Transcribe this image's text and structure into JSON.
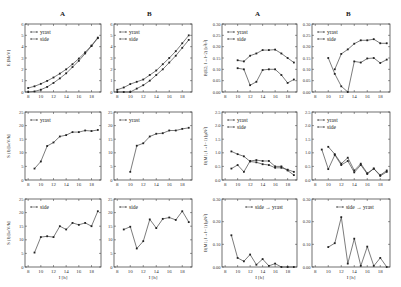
{
  "column_headers": [
    "A",
    "B",
    "A",
    "B"
  ],
  "chart_data": [
    {
      "id": "E-A",
      "type": "line",
      "column": "A",
      "row": 1,
      "ylabel": "E [MeV]",
      "xlabel": "",
      "xlim": [
        7.5,
        19.5
      ],
      "ylim": [
        0,
        6
      ],
      "xticks": [
        8,
        10,
        12,
        14,
        16,
        18
      ],
      "yticks": [
        0,
        1,
        2,
        3,
        4,
        5,
        6
      ],
      "legend": [
        "yrast",
        "side"
      ],
      "legend_position": "upper-left",
      "series": [
        {
          "name": "yrast",
          "x": [
            8,
            9,
            10,
            11,
            12,
            13,
            14,
            15,
            16,
            17,
            18,
            19
          ],
          "values": [
            0.35,
            0.5,
            0.72,
            0.98,
            1.28,
            1.62,
            2.0,
            2.45,
            2.95,
            3.5,
            4.1,
            4.8
          ]
        },
        {
          "name": "side",
          "x": [
            8,
            9,
            10,
            11,
            12,
            13,
            14,
            15,
            16,
            17,
            18,
            19
          ],
          "values": [
            0.0,
            0.05,
            0.2,
            0.45,
            0.8,
            1.2,
            1.65,
            2.2,
            2.75,
            3.4,
            4.05,
            4.75
          ]
        }
      ]
    },
    {
      "id": "E-B",
      "type": "line",
      "column": "B",
      "row": 1,
      "ylabel": "",
      "xlabel": "",
      "xlim": [
        7.5,
        19.5
      ],
      "ylim": [
        0,
        6
      ],
      "xticks": [
        8,
        10,
        12,
        14,
        16,
        18
      ],
      "yticks": [
        0,
        1,
        2,
        3,
        4,
        5,
        6
      ],
      "legend": [
        "yrast",
        "side"
      ],
      "legend_position": "upper-left",
      "series": [
        {
          "name": "yrast",
          "x": [
            8,
            9,
            10,
            11,
            12,
            13,
            14,
            15,
            16,
            17,
            18,
            19
          ],
          "values": [
            0.2,
            0.4,
            0.7,
            0.9,
            1.1,
            1.5,
            1.9,
            2.45,
            3.0,
            3.6,
            4.3,
            5.0
          ]
        },
        {
          "name": "side",
          "x": [
            8,
            9,
            10,
            11,
            12,
            13,
            14,
            15,
            16,
            17,
            18,
            19
          ],
          "values": [
            0.0,
            0.0,
            0.0,
            0.3,
            0.6,
            1.0,
            1.5,
            2.0,
            2.6,
            3.2,
            3.9,
            4.6
          ]
        }
      ]
    },
    {
      "id": "BE2-A",
      "type": "line",
      "column": "A",
      "row": 1,
      "ylabel": "B(E2; I→I−2) [e²b²]",
      "xlabel": "",
      "xlim": [
        7.5,
        19.5
      ],
      "ylim": [
        0,
        0.3
      ],
      "xticks": [
        8,
        10,
        12,
        14,
        16,
        18
      ],
      "yticks": [
        0.0,
        0.05,
        0.1,
        0.15,
        0.2,
        0.25,
        0.3
      ],
      "legend": [
        "yrast",
        "side"
      ],
      "legend_position": "upper-left",
      "series": [
        {
          "name": "yrast",
          "x": [
            10,
            11,
            12,
            13,
            14,
            15,
            16,
            17,
            18,
            19
          ],
          "values": [
            0.14,
            0.135,
            0.16,
            0.17,
            0.185,
            0.185,
            0.187,
            0.17,
            0.15,
            0.13
          ]
        },
        {
          "name": "side",
          "x": [
            10,
            11,
            12,
            13,
            14,
            15,
            16,
            17,
            18,
            19
          ],
          "values": [
            0.105,
            0.1,
            0.03,
            0.045,
            0.097,
            0.1,
            0.1,
            0.075,
            0.04,
            0.055
          ]
        }
      ]
    },
    {
      "id": "BE2-B",
      "type": "line",
      "column": "B",
      "row": 1,
      "ylabel": "",
      "xlabel": "",
      "xlim": [
        7.5,
        19.5
      ],
      "ylim": [
        0,
        0.3
      ],
      "xticks": [
        8,
        10,
        12,
        14,
        16,
        18
      ],
      "yticks": [
        0.0,
        0.05,
        0.1,
        0.15,
        0.2,
        0.25,
        0.3
      ],
      "legend": [
        "yrast",
        "side"
      ],
      "legend_position": "upper-left",
      "series": [
        {
          "name": "yrast",
          "x": [
            11,
            12,
            13,
            14,
            15,
            16,
            17,
            18,
            19
          ],
          "values": [
            0.1,
            0.168,
            0.188,
            0.213,
            0.228,
            0.228,
            0.233,
            0.215,
            0.215
          ]
        },
        {
          "name": "side",
          "x": [
            10,
            11,
            12,
            13,
            14,
            15,
            16,
            17,
            18,
            19
          ],
          "values": [
            0.15,
            0.08,
            0.025,
            0.0,
            0.135,
            0.13,
            0.148,
            0.15,
            0.128,
            0.143
          ]
        }
      ]
    },
    {
      "id": "S-yrast-A",
      "type": "line",
      "column": "A",
      "row": 2,
      "ylabel": "S (I) [keV/ħ]",
      "xlabel": "",
      "xlim": [
        7.5,
        19.5
      ],
      "ylim": [
        0,
        25
      ],
      "xticks": [
        8,
        10,
        12,
        14,
        16,
        18
      ],
      "yticks": [
        0,
        5,
        10,
        15,
        20,
        25
      ],
      "legend": [
        "yrast"
      ],
      "legend_position": "upper-left",
      "series": [
        {
          "name": "yrast",
          "x": [
            9,
            10,
            11,
            12,
            13,
            14,
            15,
            16,
            17,
            18,
            19
          ],
          "values": [
            4.2,
            6.8,
            12.5,
            13.8,
            16.0,
            16.5,
            17.6,
            17.6,
            18.2,
            18.0,
            18.4
          ]
        }
      ]
    },
    {
      "id": "S-yrast-B",
      "type": "line",
      "column": "B",
      "row": 2,
      "ylabel": "",
      "xlabel": "",
      "xlim": [
        7.5,
        19.5
      ],
      "ylim": [
        0,
        25
      ],
      "xticks": [
        8,
        10,
        12,
        14,
        16,
        18
      ],
      "yticks": [
        0,
        5,
        10,
        15,
        20,
        25
      ],
      "legend": [
        "yrast"
      ],
      "legend_position": "upper-left",
      "series": [
        {
          "name": "yrast",
          "x": [
            10,
            11,
            12,
            13,
            14,
            15,
            16,
            17,
            18,
            19
          ],
          "values": [
            3.0,
            12.6,
            13.5,
            16.0,
            17.0,
            17.2,
            18.2,
            18.2,
            18.8,
            19.2
          ]
        }
      ]
    },
    {
      "id": "BM1-A",
      "type": "line",
      "column": "A",
      "row": 2,
      "ylabel": "B(M1; I→I−1) [μN²]",
      "xlabel": "",
      "xlim": [
        7.5,
        19.5
      ],
      "ylim": [
        0,
        2.5
      ],
      "xticks": [
        8,
        10,
        12,
        14,
        16,
        18
      ],
      "yticks": [
        0.0,
        0.5,
        1.0,
        1.5,
        2.0,
        2.5
      ],
      "legend": [
        "yrast",
        "side"
      ],
      "legend_position": "upper-left",
      "series": [
        {
          "name": "yrast",
          "x": [
            9,
            10,
            11,
            12,
            13,
            14,
            15,
            16,
            17,
            18,
            19
          ],
          "values": [
            1.05,
            0.95,
            0.87,
            0.68,
            0.65,
            0.58,
            0.55,
            0.45,
            0.45,
            0.38,
            0.3
          ]
        },
        {
          "name": "side",
          "x": [
            9,
            10,
            11,
            12,
            13,
            14,
            15,
            16,
            17,
            18,
            19
          ],
          "values": [
            0.42,
            0.55,
            0.3,
            0.7,
            0.73,
            0.7,
            0.7,
            0.5,
            0.5,
            0.35,
            0.18
          ]
        }
      ]
    },
    {
      "id": "BM1-B",
      "type": "line",
      "column": "B",
      "row": 2,
      "ylabel": "",
      "xlabel": "",
      "xlim": [
        7.5,
        19.5
      ],
      "ylim": [
        0,
        2.5
      ],
      "xticks": [
        8,
        10,
        12,
        14,
        16,
        18
      ],
      "yticks": [
        0.0,
        0.5,
        1.0,
        1.5,
        2.0,
        2.5
      ],
      "legend": [
        "yrast",
        "side"
      ],
      "legend_position": "upper-left",
      "series": [
        {
          "name": "yrast",
          "x": [
            10,
            11,
            12,
            13,
            14,
            15,
            16,
            17,
            18,
            19
          ],
          "values": [
            1.22,
            0.95,
            0.6,
            0.82,
            0.35,
            0.6,
            0.25,
            0.42,
            0.18,
            0.35
          ]
        },
        {
          "name": "side",
          "x": [
            9,
            10,
            11,
            12,
            13,
            14,
            15,
            16,
            17,
            18,
            19
          ],
          "values": [
            1.12,
            0.4,
            0.92,
            0.55,
            0.7,
            0.28,
            0.55,
            0.22,
            0.42,
            0.15,
            0.3
          ]
        }
      ]
    },
    {
      "id": "S-side-A",
      "type": "line",
      "column": "A",
      "row": 3,
      "ylabel": "S (I) [keV/ħ]",
      "xlabel": "I [ħ]",
      "xlim": [
        7.5,
        19.5
      ],
      "ylim": [
        0,
        25
      ],
      "xticks": [
        8,
        10,
        12,
        14,
        16,
        18
      ],
      "yticks": [
        0,
        5,
        10,
        15,
        20,
        25
      ],
      "legend": [
        "side"
      ],
      "legend_position": "upper-left",
      "series": [
        {
          "name": "side",
          "x": [
            9,
            10,
            11,
            12,
            13,
            14,
            15,
            16,
            17,
            18,
            19
          ],
          "values": [
            5.3,
            11.0,
            11.3,
            11.0,
            15.0,
            13.8,
            16.2,
            15.5,
            16.2,
            15.0,
            20.5
          ]
        }
      ]
    },
    {
      "id": "S-side-B",
      "type": "line",
      "column": "B",
      "row": 3,
      "ylabel": "",
      "xlabel": "I [ħ]",
      "xlim": [
        7.5,
        19.5
      ],
      "ylim": [
        0,
        25
      ],
      "xticks": [
        8,
        10,
        12,
        14,
        16,
        18
      ],
      "yticks": [
        0,
        5,
        10,
        15,
        20,
        25
      ],
      "legend": [
        "side"
      ],
      "legend_position": "upper-left",
      "series": [
        {
          "name": "side",
          "x": [
            9,
            10,
            11,
            12,
            13,
            14,
            15,
            16,
            17,
            18,
            19
          ],
          "values": [
            13.8,
            14.8,
            6.8,
            9.5,
            17.5,
            14.3,
            17.7,
            18.2,
            17.3,
            20.5,
            16.5
          ]
        }
      ]
    },
    {
      "id": "BM1-link-A",
      "type": "line",
      "column": "A",
      "row": 3,
      "ylabel": "B(M1; I→I−1) [μN²]",
      "xlabel": "I [ħ]",
      "xlim": [
        7.5,
        19.5
      ],
      "ylim": [
        0,
        0.3
      ],
      "xticks": [
        8,
        10,
        12,
        14,
        16,
        18
      ],
      "yticks": [
        0.0,
        0.1,
        0.2,
        0.3
      ],
      "legend": [
        "side → yrast"
      ],
      "legend_position": "upper-center",
      "series": [
        {
          "name": "side → yrast",
          "x": [
            9,
            10,
            11,
            12,
            13,
            14,
            15,
            16,
            17,
            18,
            19
          ],
          "values": [
            0.14,
            0.04,
            0.025,
            0.055,
            0.01,
            0.035,
            0.005,
            0.015,
            0.0,
            0.0,
            0.0
          ]
        }
      ]
    },
    {
      "id": "BM1-link-B",
      "type": "line",
      "column": "B",
      "row": 3,
      "ylabel": "",
      "xlabel": "I [ħ]",
      "xlim": [
        7.5,
        19.5
      ],
      "ylim": [
        0,
        0.3
      ],
      "xticks": [
        8,
        10,
        12,
        14,
        16,
        18
      ],
      "yticks": [
        0.0,
        0.1,
        0.2,
        0.3
      ],
      "legend": [
        "side → yrast"
      ],
      "legend_position": "upper-center",
      "series": [
        {
          "name": "side → yrast",
          "x": [
            10,
            11,
            12,
            13,
            14,
            15,
            16,
            17,
            18,
            19
          ],
          "values": [
            0.088,
            0.105,
            0.22,
            0.015,
            0.125,
            0.005,
            0.09,
            0.005,
            0.04,
            0.0
          ]
        }
      ]
    }
  ]
}
